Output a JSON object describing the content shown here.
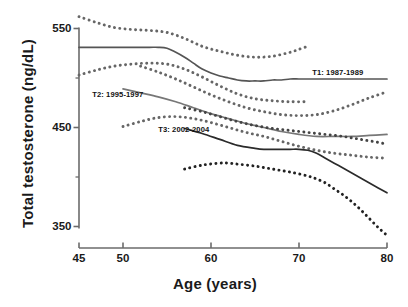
{
  "chart_data": {
    "type": "line",
    "title": "",
    "xlabel": "Age (years)",
    "ylabel": "Total testosterone (ng/dL)",
    "xlim": [
      45,
      80
    ],
    "ylim": [
      330,
      570
    ],
    "xticks": [
      45,
      50,
      60,
      70,
      80
    ],
    "xtick_labels": [
      "45",
      "50",
      "60",
      "70",
      "80"
    ],
    "yticks": [
      350,
      450,
      550
    ],
    "ytick_labels": [
      "350",
      "450",
      "550"
    ],
    "yminor_ticks": [
      400,
      500
    ],
    "grid": false,
    "legend_position": "inline-annotations",
    "annotations": [
      {
        "text": "T1: 1987-1989",
        "x": 71.5,
        "y": 505
      },
      {
        "text": "T2: 1995-1997",
        "x": 46.5,
        "y": 483
      },
      {
        "text": "T3: 2002-2004",
        "x": 54.0,
        "y": 447
      }
    ],
    "series": [
      {
        "name": "T1: 1987-1989",
        "style": "solid",
        "color": "#555555",
        "x": [
          45,
          47,
          49,
          51,
          53,
          54,
          55,
          56,
          57,
          58,
          59,
          60,
          61,
          62,
          63,
          64,
          65,
          66,
          67,
          68,
          69,
          70,
          71,
          72,
          73,
          74,
          75,
          76,
          77,
          78,
          79,
          80
        ],
        "values": [
          531,
          531,
          531,
          531,
          531,
          531,
          530,
          526,
          521,
          515,
          509,
          505,
          502,
          500,
          498,
          497,
          497,
          497,
          498,
          498,
          499,
          499,
          499,
          499,
          499,
          499,
          499,
          499,
          499,
          499,
          499,
          499
        ]
      },
      {
        "name": "T1 upper 95% CI",
        "style": "dotted",
        "color": "#666666",
        "x": [
          45,
          47,
          49,
          51,
          53,
          55,
          57,
          59,
          61,
          63,
          65,
          67,
          69,
          70,
          71
        ],
        "values": [
          562,
          556,
          551,
          549,
          548,
          546,
          540,
          532,
          527,
          523,
          521,
          522,
          526,
          529,
          532
        ]
      },
      {
        "name": "T1 lower 95% CI",
        "style": "dotted",
        "color": "#666666",
        "x": [
          45,
          47,
          49,
          51,
          53,
          55,
          57,
          59,
          61,
          63,
          65,
          67,
          69,
          71
        ],
        "values": [
          503,
          508,
          512,
          514,
          515,
          514,
          509,
          501,
          492,
          484,
          479,
          477,
          476,
          476
        ]
      },
      {
        "name": "T2: 1995-1997",
        "style": "solid",
        "color": "#777777",
        "x": [
          50,
          52,
          54,
          56,
          58,
          60,
          62,
          64,
          66,
          68,
          70,
          72,
          74,
          76,
          78,
          80
        ],
        "values": [
          489,
          485,
          481,
          476,
          470,
          464,
          459,
          454,
          450,
          446,
          443,
          441,
          441,
          441,
          442,
          443
        ]
      },
      {
        "name": "T2 upper 95% CI",
        "style": "dotted",
        "color": "#666666",
        "x": [
          52,
          54,
          56,
          58,
          60,
          62,
          64,
          66,
          68,
          70,
          72,
          74,
          76,
          78,
          80
        ],
        "values": [
          512,
          506,
          499,
          491,
          483,
          476,
          470,
          466,
          463,
          462,
          463,
          467,
          473,
          480,
          486
        ]
      },
      {
        "name": "T2 lower 95% CI",
        "style": "dotted",
        "color": "#666666",
        "x": [
          50,
          52,
          54,
          56,
          58,
          60,
          62,
          64,
          66,
          68,
          70,
          72,
          74,
          76,
          78,
          80
        ],
        "values": [
          451,
          456,
          460,
          461,
          459,
          455,
          450,
          445,
          441,
          436,
          431,
          427,
          424,
          422,
          420,
          419
        ]
      },
      {
        "name": "T3: 2002-2004",
        "style": "solid",
        "color": "#2b2b2b",
        "x": [
          57,
          59,
          61,
          63,
          65,
          66,
          67,
          68,
          69,
          70,
          71,
          72,
          73,
          74,
          75,
          76,
          77,
          78,
          79,
          80
        ],
        "values": [
          449,
          444,
          438,
          432,
          429,
          428,
          428,
          428,
          428,
          428,
          427,
          424,
          419,
          414,
          409,
          404,
          399,
          394,
          389,
          384
        ]
      },
      {
        "name": "T3 upper 95% CI",
        "style": "dotted",
        "color": "#444444",
        "x": [
          57,
          59,
          61,
          63,
          65,
          67,
          69,
          71,
          73,
          75,
          77,
          79,
          80
        ],
        "values": [
          470,
          466,
          461,
          456,
          452,
          449,
          447,
          445,
          443,
          441,
          438,
          435,
          433
        ]
      },
      {
        "name": "T3 lower 95% CI",
        "style": "dotted",
        "color": "#222222",
        "x": [
          57,
          59,
          61,
          62,
          63,
          65,
          67,
          69,
          71,
          72,
          73,
          74,
          75,
          76,
          77,
          78,
          79,
          80
        ],
        "values": [
          408,
          412,
          414,
          414,
          413,
          411,
          408,
          405,
          401,
          398,
          394,
          388,
          382,
          375,
          367,
          358,
          349,
          341
        ]
      }
    ]
  },
  "axes": {
    "y_title": "Total testosterone (ng/dL)",
    "x_title": "Age (years)"
  }
}
